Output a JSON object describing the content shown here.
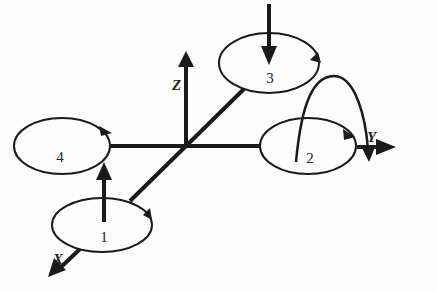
{
  "diagram": {
    "type": "quadrotor-axes",
    "axes": [
      {
        "id": "x",
        "label": "X"
      },
      {
        "id": "y",
        "label": "Y"
      },
      {
        "id": "z",
        "label": "Z"
      }
    ],
    "rotors": [
      {
        "id": 1,
        "label": "1",
        "thrust_arrow": "up"
      },
      {
        "id": 2,
        "label": "2",
        "thrust_arrow": "arc-over"
      },
      {
        "id": 3,
        "label": "3",
        "thrust_arrow": "down"
      },
      {
        "id": 4,
        "label": "4",
        "thrust_arrow": "none"
      }
    ],
    "colors": {
      "stroke": "#1a1a1a",
      "background": "#fdfdfd"
    }
  }
}
